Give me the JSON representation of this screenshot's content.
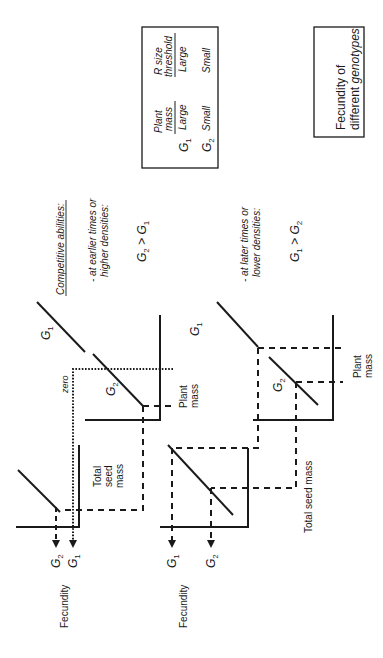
{
  "title_box": {
    "line1": "Fecundity of",
    "line2_prefix": "different ",
    "line2_italic": "genotypes"
  },
  "table": {
    "col1_header_line1": "Plant",
    "col1_header_line2": "mass",
    "col2_header_line1": "R size",
    "col2_header_line2": "threshold",
    "rows": [
      {
        "genotype": "G",
        "sub": "1",
        "plant_mass": "Large",
        "r_size_threshold": "Large"
      },
      {
        "genotype": "G",
        "sub": "2",
        "plant_mass": "Small",
        "r_size_threshold": "Small"
      }
    ]
  },
  "competitive": {
    "heading": "Competitive abilities:",
    "case1_line1": "- at earlier times or",
    "case1_line2": "higher densities:",
    "case1_relation": {
      "a": "G",
      "a_sub": "2",
      "op": " > ",
      "b": "G",
      "b_sub": "1"
    },
    "case2_line1": "- at later times or",
    "case2_line2": "lower densities:",
    "case2_relation": {
      "a": "G",
      "a_sub": "1",
      "op": " > ",
      "b": "G",
      "b_sub": "2"
    }
  },
  "upper_diagram": {
    "line_labels": [
      {
        "g": "G",
        "sub": "1"
      },
      {
        "g": "G",
        "sub": "2"
      }
    ],
    "zero_label": "zero",
    "plant_mass_axis": {
      "line1": "Plant",
      "line2": "mass"
    },
    "total_seed_mass_axis": {
      "line1": "Total",
      "line2": "seed",
      "line3": "mass"
    },
    "fecundity_label": "Fecundity",
    "arrows": [
      {
        "g": "G",
        "sub": "2"
      },
      {
        "g": "G",
        "sub": "1"
      }
    ]
  },
  "lower_diagram": {
    "line_labels": [
      {
        "g": "G",
        "sub": "1"
      },
      {
        "g": "G",
        "sub": "2"
      }
    ],
    "plant_mass_axis": {
      "line1": "Plant",
      "line2": "mass"
    },
    "total_seed_mass_axis": "Total seed mass",
    "fecundity_label": "Fecundity",
    "arrows": [
      {
        "g": "G",
        "sub": "1"
      },
      {
        "g": "G",
        "sub": "2"
      }
    ]
  },
  "colors": {
    "ink": "#1a1a1a",
    "background": "#ffffff"
  }
}
